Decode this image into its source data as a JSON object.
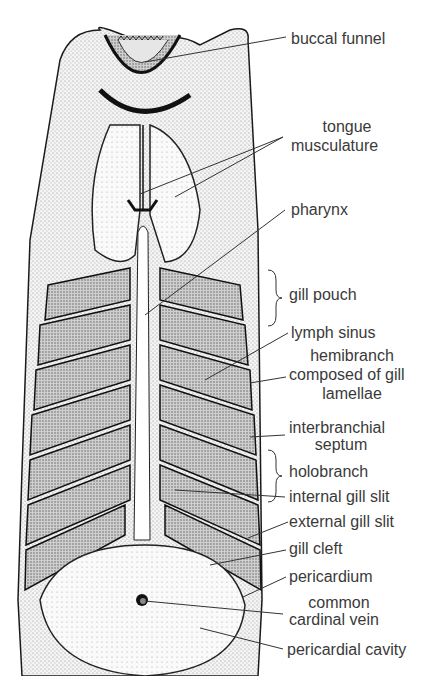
{
  "figure": {
    "colors": {
      "ink": "#1a1a1a",
      "label": "#3a3a3a",
      "stipple": "#bdbdbd",
      "background": "#ffffff"
    }
  },
  "labels": {
    "buccal_funnel": "buccal funnel",
    "tongue_musculature_1": "tongue",
    "tongue_musculature_2": "musculature",
    "pharynx": "pharynx",
    "gill_pouch": "gill pouch",
    "lymph_sinus": "lymph sinus",
    "hemibranch_1": "hemibranch",
    "hemibranch_2": "composed of gill",
    "hemibranch_3": "lamellae",
    "interbranchial_1": "interbranchial",
    "interbranchial_2": "septum",
    "holobranch": "holobranch",
    "internal_gill_slit": "internal gill slit",
    "external_gill_slit": "external gill slit",
    "gill_cleft": "gill cleft",
    "pericardium": "pericardium",
    "cardinal_1": "common",
    "cardinal_2": "cardinal vein",
    "pericardial_cavity": "pericardial cavity"
  }
}
